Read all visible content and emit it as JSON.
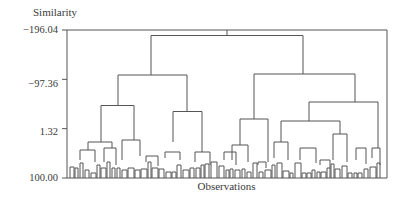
{
  "chart_data": {
    "type": "dendrogram",
    "title": "",
    "ylabel": "Similarity",
    "xlabel": "Observations",
    "y_ticks": [
      "-196.04",
      "-97.36",
      "1.32",
      "100.00"
    ],
    "y_tick_values": [
      -196.04,
      -97.36,
      1.32,
      100.0
    ],
    "ylim": [
      -196.04,
      100.0
    ],
    "frame": true,
    "grid": false,
    "line_color": "#555555",
    "top_level_clusters": 2,
    "merges": [
      {
        "name": "root",
        "x_left": 151,
        "x_right": 303,
        "similarity": -185.0
      },
      {
        "name": "left-cluster",
        "x_left": 118,
        "x_right": 187,
        "similarity": -106.0
      },
      {
        "name": "right-cluster",
        "x_left": 254,
        "x_right": 355,
        "similarity": -108.0
      },
      {
        "name": "left-left",
        "x_left": 101,
        "x_right": 134,
        "similarity": -45.0
      },
      {
        "name": "left-right",
        "x_left": 173,
        "x_right": 202,
        "similarity": -33.0
      },
      {
        "name": "right-left",
        "x_left": 240,
        "x_right": 268,
        "similarity": -18.0
      },
      {
        "name": "right-right",
        "x_left": 309,
        "x_right": 378,
        "similarity": -52.0
      },
      {
        "name": "right-right-left",
        "x_left": 293,
        "x_right": 355,
        "similarity": -38.0
      },
      {
        "name": "right-right-left-left",
        "x_left": 281,
        "x_right": 306,
        "similarity": 8.0
      },
      {
        "name": "right-right-left-right",
        "x_left": 343,
        "x_right": 354,
        "similarity": 8.0
      }
    ]
  }
}
